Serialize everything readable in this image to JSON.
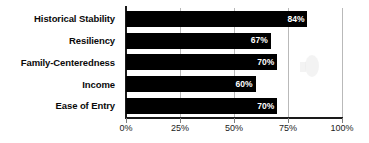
{
  "chart_data": {
    "type": "bar",
    "orientation": "horizontal",
    "title": "",
    "xlabel": "",
    "ylabel": "",
    "categories": [
      "Historical Stability",
      "Resiliency",
      "Family-Centeredness",
      "Income",
      "Ease of Entry"
    ],
    "values": [
      84,
      67,
      70,
      60,
      70
    ],
    "value_labels": [
      "84%",
      "67%",
      "70%",
      "60%",
      "70%"
    ],
    "xlim": [
      0,
      100
    ],
    "xticks": [
      0,
      25,
      50,
      75,
      100
    ],
    "xtick_labels": [
      "0%",
      "25%",
      "50%",
      "75%",
      "100%"
    ],
    "grid": true,
    "legend": false,
    "bar_color": "#000000",
    "value_label_color": "#ffffff",
    "gridline_color": "#b9b9b9",
    "axis_color": "#1a1a1a",
    "background": "#ffffff"
  }
}
